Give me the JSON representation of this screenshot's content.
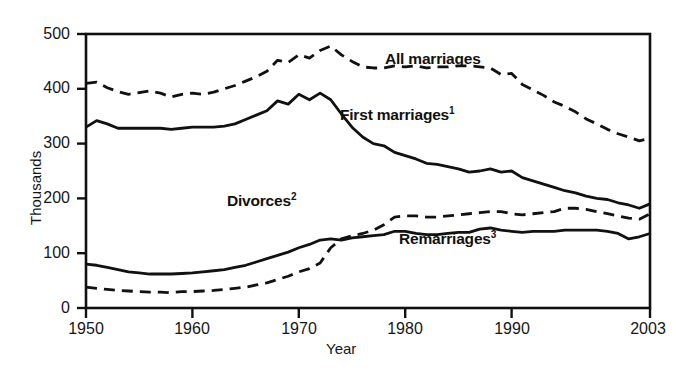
{
  "figure": {
    "ylabel": "Thousands",
    "xlabel": "Year",
    "background": "#ffffff",
    "line_color": "#111111"
  },
  "axes": {
    "y_ticks": [
      "0",
      "100",
      "200",
      "300",
      "400",
      "500"
    ],
    "x_ticks": [
      "1950",
      "1960",
      "1970",
      "1980",
      "1990",
      "2003"
    ]
  },
  "series_labels": {
    "all_marriages": "All marriages",
    "first_marriages": "First marriages",
    "first_marriages_note": "1",
    "divorces": "Divorces",
    "divorces_note": "2",
    "remarriages": "Remarriages",
    "remarriages_note": "3"
  },
  "chart_data": {
    "type": "line",
    "title": "",
    "xlabel": "Year",
    "ylabel": "Thousands",
    "xlim": [
      1950,
      2003
    ],
    "ylim": [
      0,
      500
    ],
    "grid": false,
    "legend": "inline-annotations",
    "x": [
      1950,
      1951,
      1952,
      1953,
      1954,
      1955,
      1956,
      1957,
      1958,
      1959,
      1960,
      1961,
      1962,
      1963,
      1964,
      1965,
      1966,
      1967,
      1968,
      1969,
      1970,
      1971,
      1972,
      1973,
      1974,
      1975,
      1976,
      1977,
      1978,
      1979,
      1980,
      1981,
      1982,
      1983,
      1984,
      1985,
      1986,
      1987,
      1988,
      1989,
      1990,
      1991,
      1992,
      1993,
      1994,
      1995,
      1996,
      1997,
      1998,
      1999,
      2000,
      2001,
      2002,
      2003
    ],
    "series": [
      {
        "name": "All marriages",
        "style": "dashed",
        "values": [
          410,
          412,
          402,
          395,
          390,
          393,
          396,
          392,
          385,
          390,
          392,
          390,
          394,
          400,
          406,
          414,
          422,
          432,
          452,
          448,
          462,
          456,
          470,
          478,
          462,
          450,
          440,
          438,
          438,
          442,
          440,
          442,
          438,
          440,
          440,
          442,
          442,
          440,
          438,
          426,
          428,
          408,
          398,
          388,
          376,
          368,
          358,
          345,
          336,
          326,
          318,
          312,
          305,
          310
        ]
      },
      {
        "name": "First marriages",
        "style": "solid",
        "values": [
          330,
          342,
          336,
          328,
          328,
          328,
          328,
          328,
          326,
          328,
          330,
          330,
          330,
          332,
          336,
          344,
          352,
          360,
          378,
          372,
          390,
          380,
          392,
          380,
          354,
          330,
          312,
          300,
          296,
          284,
          278,
          272,
          264,
          262,
          258,
          254,
          248,
          250,
          254,
          248,
          250,
          238,
          232,
          226,
          220,
          214,
          210,
          204,
          200,
          198,
          192,
          188,
          182,
          190
        ]
      },
      {
        "name": "Divorces",
        "style": "dashed",
        "values": [
          38,
          36,
          34,
          32,
          31,
          30,
          29,
          29,
          28,
          30,
          30,
          31,
          32,
          34,
          36,
          38,
          42,
          46,
          52,
          58,
          66,
          72,
          82,
          110,
          126,
          132,
          136,
          142,
          152,
          166,
          168,
          168,
          166,
          166,
          168,
          170,
          172,
          174,
          176,
          176,
          172,
          170,
          172,
          174,
          176,
          182,
          182,
          180,
          176,
          172,
          168,
          164,
          162,
          172
        ]
      },
      {
        "name": "Remarriages",
        "style": "solid",
        "values": [
          80,
          78,
          74,
          70,
          66,
          64,
          62,
          62,
          62,
          63,
          64,
          66,
          68,
          70,
          74,
          78,
          84,
          90,
          96,
          102,
          110,
          116,
          124,
          126,
          124,
          128,
          130,
          132,
          134,
          140,
          140,
          136,
          134,
          134,
          136,
          138,
          138,
          144,
          146,
          142,
          140,
          138,
          140,
          140,
          140,
          142,
          142,
          142,
          142,
          140,
          136,
          126,
          130,
          136
        ]
      }
    ],
    "annotations": [
      {
        "text": "All marriages",
        "x": 1977,
        "y": 448
      },
      {
        "text": "First marriages1",
        "x": 1977,
        "y": 340
      },
      {
        "text": "Divorces2",
        "x": 1971,
        "y": 210
      },
      {
        "text": "Remarriages3",
        "x": 1983,
        "y": 128
      }
    ]
  }
}
